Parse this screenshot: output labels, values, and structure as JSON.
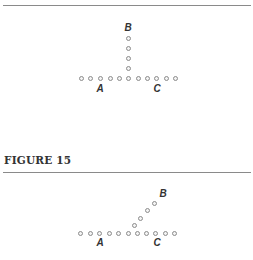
{
  "top_figure": {
    "rule_y": 5,
    "baseline_dots": [
      [
        81,
        78
      ],
      [
        90,
        78
      ],
      [
        100,
        78
      ],
      [
        110,
        78
      ],
      [
        119,
        78
      ],
      [
        128,
        78
      ],
      [
        138,
        78
      ],
      [
        147,
        78
      ],
      [
        156,
        78
      ],
      [
        166,
        78
      ],
      [
        175,
        78
      ]
    ],
    "branch_dots": [
      [
        128,
        68
      ],
      [
        128,
        58
      ],
      [
        128,
        48
      ],
      [
        128,
        38
      ]
    ],
    "labels": [
      {
        "text": "A",
        "x": 100,
        "y": 89
      },
      {
        "text": "B",
        "x": 128,
        "y": 28
      },
      {
        "text": "C",
        "x": 157,
        "y": 89
      }
    ]
  },
  "caption": "FIGURE 15",
  "bottom_figure": {
    "rule_y": 172,
    "baseline_dots": [
      [
        80,
        233
      ],
      [
        90,
        233
      ],
      [
        99,
        233
      ],
      [
        109,
        233
      ],
      [
        118,
        233
      ],
      [
        128,
        233
      ],
      [
        137,
        233
      ],
      [
        146,
        233
      ],
      [
        155,
        233
      ],
      [
        165,
        233
      ],
      [
        174,
        233
      ]
    ],
    "branch_dots": [
      [
        134,
        225
      ],
      [
        140,
        218
      ],
      [
        147,
        210
      ],
      [
        154,
        203
      ]
    ],
    "labels": [
      {
        "text": "A",
        "x": 100,
        "y": 243
      },
      {
        "text": "B",
        "x": 163,
        "y": 194
      },
      {
        "text": "C",
        "x": 157,
        "y": 243
      }
    ]
  },
  "colors": {
    "dot_stroke": "#8c8c8c",
    "rule": "#8a8a8a",
    "text": "#333333"
  }
}
